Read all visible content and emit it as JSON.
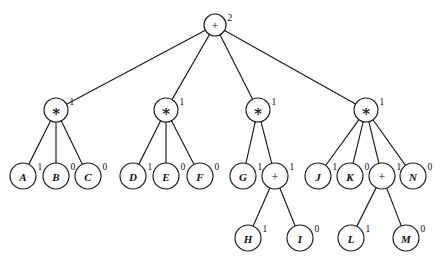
{
  "diagram": {
    "type": "tree",
    "background_color": "#ffffff",
    "stroke_color": "#1a1a1a",
    "nodes": [
      {
        "id": "root",
        "label": "+",
        "kind": "op-plus",
        "annotation": "2",
        "x": 215,
        "y": 25,
        "r": 11
      },
      {
        "id": "m1",
        "label": "∗",
        "kind": "op-mul",
        "annotation": "1",
        "x": 56,
        "y": 110,
        "r": 12
      },
      {
        "id": "m2",
        "label": "∗",
        "kind": "op-mul",
        "annotation": "1",
        "x": 166,
        "y": 110,
        "r": 12
      },
      {
        "id": "m3",
        "label": "∗",
        "kind": "op-mul",
        "annotation": "1",
        "x": 258,
        "y": 110,
        "r": 12
      },
      {
        "id": "m4",
        "label": "∗",
        "kind": "op-mul",
        "annotation": "1",
        "x": 366,
        "y": 110,
        "r": 12
      },
      {
        "id": "A",
        "label": "A",
        "kind": "leaf",
        "annotation": "1",
        "x": 23,
        "y": 176,
        "r": 13
      },
      {
        "id": "B",
        "label": "B",
        "kind": "leaf",
        "annotation": "0",
        "x": 56,
        "y": 176,
        "r": 13
      },
      {
        "id": "C",
        "label": "C",
        "kind": "leaf",
        "annotation": "0",
        "x": 88,
        "y": 176,
        "r": 13
      },
      {
        "id": "D",
        "label": "D",
        "kind": "leaf",
        "annotation": "1",
        "x": 133,
        "y": 176,
        "r": 13
      },
      {
        "id": "E",
        "label": "E",
        "kind": "leaf",
        "annotation": "0",
        "x": 166,
        "y": 176,
        "r": 13
      },
      {
        "id": "F",
        "label": "F",
        "kind": "leaf",
        "annotation": "0",
        "x": 200,
        "y": 176,
        "r": 13
      },
      {
        "id": "G",
        "label": "G",
        "kind": "leaf",
        "annotation": "1",
        "x": 243,
        "y": 176,
        "r": 13
      },
      {
        "id": "p1",
        "label": "+",
        "kind": "op-plus",
        "annotation": "1",
        "x": 275,
        "y": 176,
        "r": 13
      },
      {
        "id": "J",
        "label": "J",
        "kind": "leaf",
        "annotation": "1",
        "x": 318,
        "y": 176,
        "r": 13
      },
      {
        "id": "K",
        "label": "K",
        "kind": "leaf",
        "annotation": "0",
        "x": 350,
        "y": 176,
        "r": 13
      },
      {
        "id": "p2",
        "label": "+",
        "kind": "op-plus",
        "annotation": "1",
        "x": 382,
        "y": 176,
        "r": 13
      },
      {
        "id": "N",
        "label": "N",
        "kind": "leaf",
        "annotation": "0",
        "x": 413,
        "y": 176,
        "r": 13
      },
      {
        "id": "H",
        "label": "H",
        "kind": "leaf",
        "annotation": "1",
        "x": 248,
        "y": 238,
        "r": 13
      },
      {
        "id": "I",
        "label": "I",
        "kind": "leaf",
        "annotation": "0",
        "x": 300,
        "y": 238,
        "r": 13
      },
      {
        "id": "L",
        "label": "L",
        "kind": "leaf",
        "annotation": "1",
        "x": 351,
        "y": 238,
        "r": 13
      },
      {
        "id": "M",
        "label": "M",
        "kind": "leaf",
        "annotation": "0",
        "x": 406,
        "y": 238,
        "r": 13
      }
    ],
    "edges": [
      {
        "from": "root",
        "to": "m1"
      },
      {
        "from": "root",
        "to": "m2"
      },
      {
        "from": "root",
        "to": "m3"
      },
      {
        "from": "root",
        "to": "m4"
      },
      {
        "from": "m1",
        "to": "A"
      },
      {
        "from": "m1",
        "to": "B"
      },
      {
        "from": "m1",
        "to": "C"
      },
      {
        "from": "m2",
        "to": "D"
      },
      {
        "from": "m2",
        "to": "E"
      },
      {
        "from": "m2",
        "to": "F"
      },
      {
        "from": "m3",
        "to": "G"
      },
      {
        "from": "m3",
        "to": "p1"
      },
      {
        "from": "m4",
        "to": "J"
      },
      {
        "from": "m4",
        "to": "K"
      },
      {
        "from": "m4",
        "to": "p2"
      },
      {
        "from": "m4",
        "to": "N"
      },
      {
        "from": "p1",
        "to": "H"
      },
      {
        "from": "p1",
        "to": "I"
      },
      {
        "from": "p2",
        "to": "L"
      },
      {
        "from": "p2",
        "to": "M"
      }
    ]
  }
}
